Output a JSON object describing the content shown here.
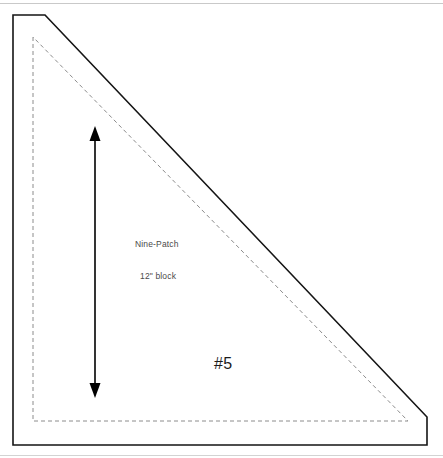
{
  "page": {
    "width": 443,
    "height": 458,
    "background_color": "#ffffff",
    "rule_color": "#c9c9c9"
  },
  "diagram": {
    "title_hidden": true,
    "type": "quilt-template-pattern-piece",
    "cut_line": {
      "name": "outer-cut-line",
      "style": "solid",
      "color": "#151515",
      "stroke_width": 1.6,
      "points": "13,15 45,15 427,417 427,445 13,445"
    },
    "seam_line": {
      "name": "inner-seam-line",
      "style": "dashed",
      "color": "#8c8c8c",
      "stroke_width": 1,
      "dash_pattern": "4,3",
      "points": "33,37 33,421 408,421"
    },
    "dimension_arrow": {
      "name": "height-dimension-arrow",
      "color": "#000000",
      "x": 95,
      "y_top": 127,
      "y_bottom": 397,
      "double_headed": true
    }
  },
  "labels": {
    "pattern_name": "Nine-Patch",
    "block_size": "12\" block",
    "piece_number": "#5"
  }
}
